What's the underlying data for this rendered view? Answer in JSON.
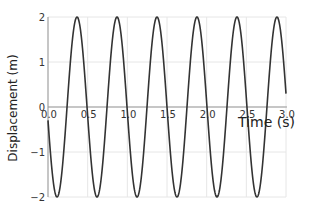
{
  "chart_data": {
    "type": "line",
    "title": "",
    "xlabel": "Time (s)",
    "ylabel": "Displacement (m)",
    "xlim": [
      0,
      3.0
    ],
    "ylim": [
      -2,
      2
    ],
    "grid": true,
    "legend": null,
    "x_ticks": [
      "0.0",
      "0.5",
      "1.0",
      "1.5",
      "2.0",
      "2.5",
      "3.0"
    ],
    "y_ticks": [
      "-2",
      "-1",
      "0",
      "1",
      "2"
    ],
    "series": [
      {
        "name": "displacement",
        "color": "#333333",
        "description": "Sinusoid, amplitude 2 m, period ~0.5 s (~2 Hz), starting near 0 and decreasing first; first max ~0.37 s",
        "amplitude": 2,
        "period": 0.504,
        "first_peak_t": 0.366,
        "x": [
          0.0,
          0.12,
          0.37,
          0.62,
          0.87,
          1.12,
          1.37,
          1.62,
          1.87,
          2.12,
          2.37,
          2.62,
          2.87,
          3.0
        ],
        "values": [
          0.0,
          -2,
          2,
          -2,
          2,
          -2,
          2,
          -2,
          2,
          -2,
          2,
          -2,
          2,
          0.3
        ]
      }
    ]
  },
  "colors": {
    "line": "#333333",
    "grid": "#e6e6e6",
    "axis": "#999999",
    "background": "#ffffff"
  }
}
